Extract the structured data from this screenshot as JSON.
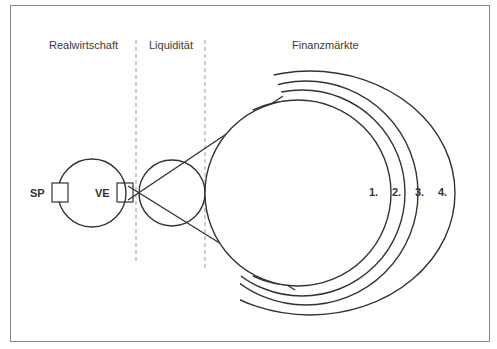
{
  "diagram": {
    "sections": [
      {
        "label": "Realwirtschaft"
      },
      {
        "label": "Liquidität"
      },
      {
        "label": "Finanzmärkte"
      }
    ],
    "nodes": {
      "sp": "SP",
      "ve": "VE"
    },
    "rings": [
      "1.",
      "2.",
      "3.",
      "4."
    ],
    "colors": {
      "line": "#333333",
      "frame": "#888888",
      "divider": "#9a9a9a"
    }
  }
}
